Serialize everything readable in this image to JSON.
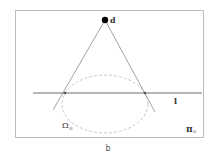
{
  "diagram": {
    "point_label": "d",
    "line_label": "l",
    "conic_label_main": "Ω",
    "conic_label_sub": "∞",
    "plane_label_main": "π",
    "plane_label_sub": "∞",
    "caption": "b"
  },
  "colors": {
    "frame": "#bdbdbd",
    "lines": "#8a8a8a",
    "horizontal_line": "#6e6e6e",
    "ellipse_dashed": "#c8c8c8",
    "point": "#000000"
  }
}
